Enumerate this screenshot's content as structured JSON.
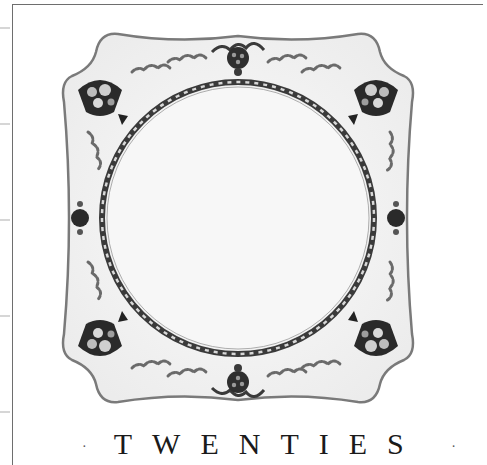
{
  "image": {
    "subject": "square scalloped porcelain plate with floral basket border",
    "plate_motifs": [
      "flower-basket-corner",
      "grape-cluster-top",
      "grape-cluster-bottom",
      "floral-side-left",
      "floral-side-right",
      "rope-band-inner-ring"
    ],
    "colors": {
      "background": "#ffffff",
      "plate_body": "#f4f4f4",
      "plate_rim_edge": "#7a7a7a",
      "motif_dark": "#2a2a2a",
      "motif_mid": "#8a8a8a",
      "frame_line": "#6e6e6e",
      "tick": "#d6d6d6"
    }
  },
  "heading": {
    "text": "TWENTIES",
    "prefix_fragment": "·",
    "suffix_fragment": "·"
  },
  "side_ticks": [
    27,
    123,
    219,
    315,
    411
  ]
}
